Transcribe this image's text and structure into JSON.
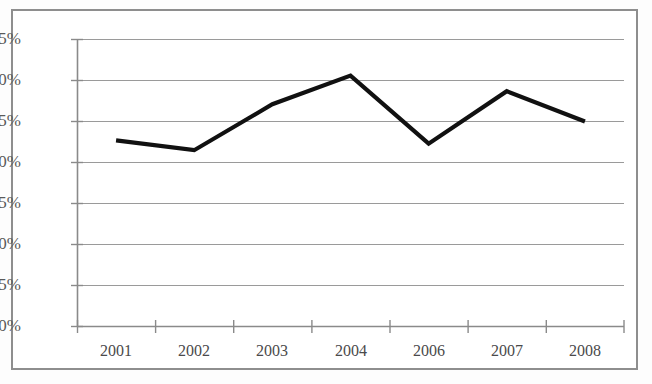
{
  "chart_data": {
    "type": "line",
    "title": "",
    "subtitle": "",
    "xlabel": "",
    "ylabel": "",
    "categories": [
      "2001",
      "2002",
      "2003",
      "2004",
      "2006",
      "2007",
      "2008"
    ],
    "values": [
      22.7,
      21.5,
      27.1,
      30.6,
      22.3,
      28.7,
      25.0
    ],
    "series": [
      {
        "name": "",
        "values": [
          22.7,
          21.5,
          27.1,
          30.6,
          22.3,
          28.7,
          25.0
        ]
      }
    ],
    "ylim": [
      0,
      35
    ],
    "ytick_values": [
      0,
      5,
      10,
      15,
      20,
      25,
      30,
      35
    ],
    "ytick_labels": [
      "0%",
      "5%",
      "10%",
      "15%",
      "20%",
      "25%",
      "30%",
      "35%"
    ],
    "xtick_labels": [
      "2001",
      "2002",
      "2003",
      "2004",
      "2006",
      "2007",
      "2008"
    ],
    "grid": "horizontal",
    "legend": "none",
    "annotations": [],
    "colors": {
      "line": "#111111",
      "grid": "#9a9a9a",
      "axis": "#8a8a8a",
      "frame": "#8e8e8e",
      "background": "#ffffff",
      "tick_text": "#5a5a5a"
    }
  }
}
